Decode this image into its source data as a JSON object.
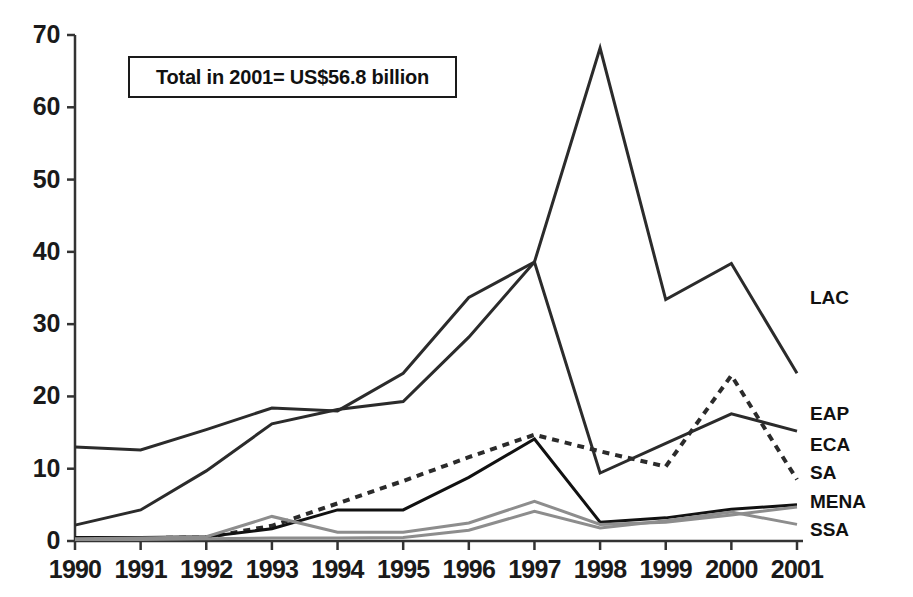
{
  "annotation": {
    "text": "Total in 2001= US$56.8 billion"
  },
  "axes": {
    "y_ticks": [
      "0",
      "10",
      "20",
      "30",
      "40",
      "50",
      "60",
      "70"
    ],
    "x_ticks": [
      "1990",
      "1991",
      "1992",
      "1993",
      "1994",
      "1995",
      "1996",
      "1997",
      "1998",
      "1999",
      "2000",
      "2001"
    ]
  },
  "series_labels": {
    "lac": "LAC",
    "eap": "EAP",
    "eca": "ECA",
    "sa": "SA",
    "mena": "MENA",
    "ssa": "SSA"
  },
  "colors": {
    "line_dark": "#2b2b2b",
    "line_black": "#111111",
    "line_gray": "#8d8d8d",
    "axis": "#333333",
    "text": "#111111",
    "background": "#ffffff"
  },
  "chart_data": {
    "type": "line",
    "title": "",
    "subtitle": "",
    "xlabel": "",
    "ylabel": "",
    "xlim": [
      1990,
      2001
    ],
    "ylim": [
      0,
      70
    ],
    "ytick_step": 10,
    "grid": false,
    "legend_position": "right-end-of-line",
    "annotation": "Total in 2001= US$56.8 billion",
    "x": [
      1990,
      1991,
      1992,
      1993,
      1994,
      1995,
      1996,
      1997,
      1998,
      1999,
      2000,
      2001
    ],
    "series": [
      {
        "name": "LAC",
        "style": "solid",
        "color": "#2b2b2b",
        "width": 3,
        "values": [
          13.0,
          12.6,
          15.4,
          18.4,
          18.0,
          23.2,
          33.7,
          38.6,
          68.2,
          33.4,
          38.4,
          23.2
        ]
      },
      {
        "name": "EAP",
        "style": "solid",
        "color": "#2b2b2b",
        "width": 3,
        "values": [
          2.2,
          4.3,
          9.7,
          16.2,
          18.2,
          19.3,
          28.2,
          38.6,
          9.4,
          13.5,
          17.6,
          15.2
        ]
      },
      {
        "name": "SA",
        "style": "dotted",
        "color": "#2b2b2b",
        "width": 4,
        "values": [
          0.4,
          0.4,
          0.5,
          2.1,
          5.2,
          8.3,
          11.6,
          14.7,
          12.4,
          10.3,
          22.9,
          8.5
        ]
      },
      {
        "name": "MENA",
        "style": "solid",
        "color": "#111111",
        "width": 3,
        "values": [
          0.5,
          0.5,
          0.6,
          1.7,
          4.3,
          4.3,
          8.8,
          14.1,
          2.6,
          3.2,
          4.4,
          5.0
        ]
      },
      {
        "name": "ECA",
        "style": "solid",
        "color": "#8d8d8d",
        "width": 3,
        "values": [
          0.3,
          0.4,
          0.6,
          3.4,
          1.2,
          1.2,
          2.5,
          5.5,
          2.3,
          2.6,
          3.6,
          4.7
        ]
      },
      {
        "name": "SSA",
        "style": "solid",
        "color": "#8d8d8d",
        "width": 3,
        "values": [
          0.2,
          0.2,
          0.3,
          0.4,
          0.4,
          0.5,
          1.5,
          4.1,
          1.8,
          2.8,
          4.0,
          2.3
        ]
      }
    ]
  }
}
